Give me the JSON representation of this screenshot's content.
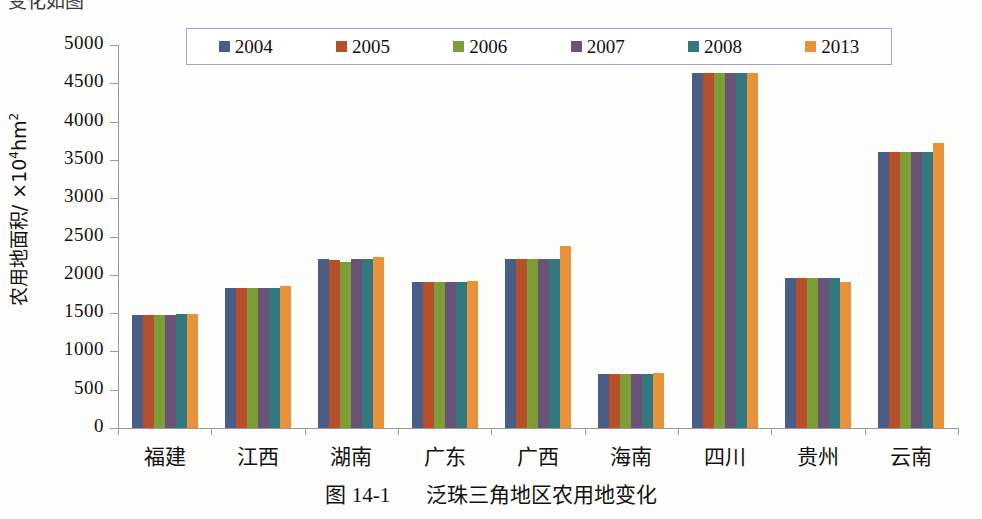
{
  "figure": {
    "caption_prefix": "图 14-1",
    "caption_text": "泛珠三角地区农用地变化",
    "top_cut_fragment": "变化如图"
  },
  "axis": {
    "y_title_main": "农用地面积/ ×10",
    "y_title_sup": "4",
    "y_title_unit": "hm",
    "y_title_unit_sup": "2",
    "y_ticks": [
      "5000",
      "4500",
      "4000",
      "3500",
      "3000",
      "2500",
      "2000",
      "1500",
      "1000",
      "500",
      "0"
    ]
  },
  "legend": {
    "items": [
      {
        "label": "2004",
        "color": "#4a5d86"
      },
      {
        "label": "2005",
        "color": "#b7502a"
      },
      {
        "label": "2006",
        "color": "#7d9e36"
      },
      {
        "label": "2007",
        "color": "#6b5277"
      },
      {
        "label": "2008",
        "color": "#33787f"
      },
      {
        "label": "2013",
        "color": "#e8923a"
      }
    ]
  },
  "chart_data": {
    "type": "bar",
    "title": "泛珠三角地区农用地变化",
    "xlabel": "",
    "ylabel": "农用地面积/ ×10⁴hm²",
    "ylim": [
      0,
      5000
    ],
    "ytick_step": 500,
    "grid": false,
    "legend_position": "top",
    "categories": [
      "福建",
      "江西",
      "湖南",
      "广东",
      "广西",
      "海南",
      "四川",
      "贵州",
      "云南"
    ],
    "series": [
      {
        "name": "2004",
        "color": "#4a5d86",
        "values": [
          1480,
          1830,
          2200,
          1905,
          2205,
          700,
          4640,
          1955,
          3600
        ]
      },
      {
        "name": "2005",
        "color": "#b7502a",
        "values": [
          1480,
          1830,
          2195,
          1905,
          2205,
          700,
          4640,
          1955,
          3600
        ]
      },
      {
        "name": "2006",
        "color": "#7d9e36",
        "values": [
          1480,
          1830,
          2170,
          1905,
          2205,
          700,
          4640,
          1955,
          3600
        ]
      },
      {
        "name": "2007",
        "color": "#6b5277",
        "values": [
          1480,
          1830,
          2200,
          1905,
          2205,
          700,
          4640,
          1955,
          3600
        ]
      },
      {
        "name": "2008",
        "color": "#33787f",
        "values": [
          1485,
          1830,
          2200,
          1905,
          2205,
          700,
          4640,
          1955,
          3605
        ]
      },
      {
        "name": "2013",
        "color": "#e8923a",
        "values": [
          1490,
          1860,
          2230,
          1920,
          2380,
          715,
          4640,
          1900,
          3720
        ]
      }
    ]
  }
}
